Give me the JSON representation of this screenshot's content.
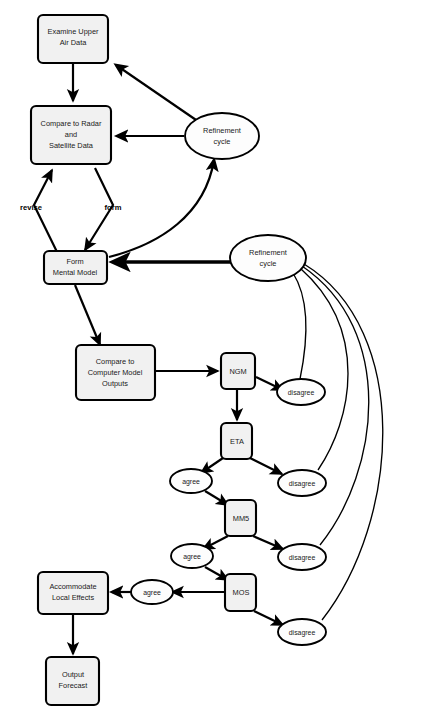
{
  "diagram": {
    "background_color": "#ffffff",
    "node_fill_color": "#f1f1f1",
    "stroke_color": "#000000",
    "nodes": [
      {
        "id": "examine_upper_air",
        "shape": "box",
        "label": "Examine Upper\nAir Data",
        "line1": "Examine Upper",
        "line2": "Air Data",
        "line3": ""
      },
      {
        "id": "compare_radar",
        "shape": "box",
        "label": "Compare to Radar\nand\nSatellite Data",
        "line1": "Compare to Radar",
        "line2": "and",
        "line3": "Satellite Data"
      },
      {
        "id": "form_mental_model",
        "shape": "box",
        "label": "Form\nMental Model",
        "line1": "Form",
        "line2": "Mental Model",
        "line3": ""
      },
      {
        "id": "compare_computer",
        "shape": "box",
        "label": "Compare to\nComputer Model\nOutputs",
        "line1": "Compare to",
        "line2": "Computer Model",
        "line3": "Outputs"
      },
      {
        "id": "accommodate",
        "shape": "box",
        "label": "Accommodate\nLocal Effects",
        "line1": "Accommodate",
        "line2": "Local Effects",
        "line3": ""
      },
      {
        "id": "output_forecast",
        "shape": "box",
        "label": "Output\nForecast",
        "line1": "Output",
        "line2": "Forecast",
        "line3": ""
      },
      {
        "id": "ngm",
        "shape": "box",
        "label": "NGM",
        "line1": "NGM",
        "line2": "",
        "line3": ""
      },
      {
        "id": "eta",
        "shape": "box",
        "label": "ETA",
        "line1": "ETA",
        "line2": "",
        "line3": ""
      },
      {
        "id": "mm5",
        "shape": "box",
        "label": "MM5",
        "line1": "MM5",
        "line2": "",
        "line3": ""
      },
      {
        "id": "mos",
        "shape": "box",
        "label": "MOS",
        "line1": "MOS",
        "line2": "",
        "line3": ""
      },
      {
        "id": "refinement_top",
        "shape": "ellipse",
        "label": "Refinement\ncycle",
        "line1": "Refinement",
        "line2": "cycle",
        "line3": ""
      },
      {
        "id": "refinement_right",
        "shape": "ellipse",
        "label": "Refinement\ncycle",
        "line1": "Refinement",
        "line2": "cycle",
        "line3": ""
      },
      {
        "id": "disagree_ngm",
        "shape": "ellipse",
        "label": "disagree",
        "line1": "disagree",
        "line2": "",
        "line3": ""
      },
      {
        "id": "disagree_eta",
        "shape": "ellipse",
        "label": "disagree",
        "line1": "disagree",
        "line2": "",
        "line3": ""
      },
      {
        "id": "disagree_mm5",
        "shape": "ellipse",
        "label": "disagree",
        "line1": "disagree",
        "line2": "",
        "line3": ""
      },
      {
        "id": "disagree_mos",
        "shape": "ellipse",
        "label": "disagree",
        "line1": "disagree",
        "line2": "",
        "line3": ""
      },
      {
        "id": "agree_eta",
        "shape": "ellipse",
        "label": "agree",
        "line1": "agree",
        "line2": "",
        "line3": ""
      },
      {
        "id": "agree_mm5",
        "shape": "ellipse",
        "label": "agree",
        "line1": "agree",
        "line2": "",
        "line3": ""
      },
      {
        "id": "agree_mos",
        "shape": "ellipse",
        "label": "agree",
        "line1": "agree",
        "line2": "",
        "line3": ""
      }
    ],
    "edge_labels": [
      {
        "id": "revise",
        "label": "revise"
      },
      {
        "id": "form",
        "label": "form"
      }
    ],
    "edges": [
      {
        "from": "examine_upper_air",
        "to": "compare_radar",
        "label": ""
      },
      {
        "from": "compare_radar",
        "to": "form_mental_model",
        "label": "revise"
      },
      {
        "from": "compare_radar",
        "to": "form_mental_model",
        "label": "form"
      },
      {
        "from": "refinement_top",
        "to": "examine_upper_air",
        "label": ""
      },
      {
        "from": "refinement_top",
        "to": "compare_radar",
        "label": ""
      },
      {
        "from": "form_mental_model",
        "to": "refinement_top",
        "label": ""
      },
      {
        "from": "refinement_right",
        "to": "form_mental_model",
        "label": ""
      },
      {
        "from": "form_mental_model",
        "to": "compare_computer",
        "label": ""
      },
      {
        "from": "compare_computer",
        "to": "ngm",
        "label": ""
      },
      {
        "from": "ngm",
        "to": "disagree_ngm",
        "label": ""
      },
      {
        "from": "ngm",
        "to": "eta",
        "label": ""
      },
      {
        "from": "eta",
        "to": "agree_eta",
        "label": ""
      },
      {
        "from": "eta",
        "to": "disagree_eta",
        "label": ""
      },
      {
        "from": "agree_eta",
        "to": "mm5",
        "label": ""
      },
      {
        "from": "mm5",
        "to": "agree_mm5",
        "label": ""
      },
      {
        "from": "mm5",
        "to": "disagree_mm5",
        "label": ""
      },
      {
        "from": "agree_mm5",
        "to": "mos",
        "label": ""
      },
      {
        "from": "mos",
        "to": "agree_mos",
        "label": ""
      },
      {
        "from": "mos",
        "to": "disagree_mos",
        "label": ""
      },
      {
        "from": "agree_mos",
        "to": "accommodate",
        "label": ""
      },
      {
        "from": "accommodate",
        "to": "output_forecast",
        "label": ""
      },
      {
        "from": "disagree_ngm",
        "to": "refinement_right",
        "label": ""
      },
      {
        "from": "disagree_eta",
        "to": "refinement_right",
        "label": ""
      },
      {
        "from": "disagree_mm5",
        "to": "refinement_right",
        "label": ""
      },
      {
        "from": "disagree_mos",
        "to": "refinement_right",
        "label": ""
      }
    ]
  }
}
